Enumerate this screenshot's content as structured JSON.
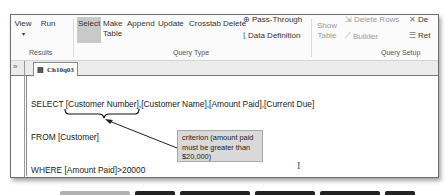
{
  "ribbon": {
    "groups": {
      "results": {
        "label": "Results",
        "buttons": [
          {
            "label": "View",
            "sub": "▾"
          },
          {
            "label": "Run"
          }
        ]
      },
      "query_type": {
        "label": "Query Type",
        "buttons": [
          {
            "label": "Select",
            "selected": true
          },
          {
            "label": "Make",
            "label2": "Table"
          },
          {
            "label": "Append"
          },
          {
            "label": "Update"
          },
          {
            "label": "Crosstab"
          },
          {
            "label": "Delete"
          }
        ],
        "small_items": [
          {
            "label": "Pass-Through"
          },
          {
            "label": "Data Definition"
          }
        ]
      },
      "query_setup": {
        "label": "Query Setup",
        "show_table": {
          "label": "Show",
          "label2": "Table"
        },
        "small_items": [
          {
            "label": "Delete Rows"
          },
          {
            "label": "Builder"
          },
          {
            "label": "De"
          },
          {
            "label": "Ret"
          }
        ]
      }
    }
  },
  "nav_pane": {
    "toggle": "»"
  },
  "document_tab": {
    "label": "Ch10q03"
  },
  "sql_editor": {
    "lines": [
      "SELECT [Customer Number],[Customer Name],[Amount Paid],[Current Due]",
      "FROM [Customer]",
      "WHERE [Amount Paid]>20000",
      ";"
    ]
  },
  "callout": {
    "text": "criterion (amount paid must be greater than $20,000)"
  },
  "colors": {
    "selected_button": "#c9c9c9",
    "callout_bg": "#d9d9d9"
  }
}
